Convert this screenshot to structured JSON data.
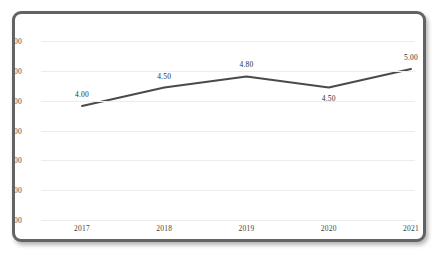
{
  "title": {
    "text": "",
    "truncated": true
  },
  "chart_data": {
    "type": "line",
    "title": "",
    "xlabel": "",
    "ylabel": "",
    "categories": [
      "2017",
      "2018",
      "2019",
      "2020",
      "2021"
    ],
    "values": [
      4.0,
      4.5,
      4.8,
      4.5,
      5.0
    ],
    "point_labels": [
      "4.00",
      "4.50",
      "4.80",
      "4.50",
      "5.00"
    ],
    "label_positions": [
      "above",
      "above",
      "above",
      "below",
      "above"
    ],
    "series": [
      {
        "name": "",
        "values": [
          4.0,
          4.5,
          4.8,
          4.5,
          5.0
        ]
      }
    ],
    "y_tick_labels": [
      "00",
      "00",
      "00",
      "00",
      "00",
      "00",
      "00"
    ],
    "y_tick_labels_truncated": true,
    "gridlines": 7,
    "grid": true,
    "legend": "none",
    "line_color": "#4a4a4a",
    "grid_color": "#ececec",
    "plot_background": "#ffffff",
    "frame_color": "#636363"
  }
}
